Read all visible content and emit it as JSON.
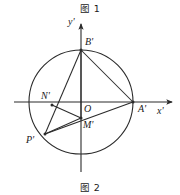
{
  "figure": {
    "caption_top": "图 1",
    "caption_bottom": "图 2",
    "stroke_color": "#2b2b2b",
    "background_color": "#ffffff"
  },
  "axes": {
    "x_label": "x'",
    "y_label": "y'",
    "origin_label": "O"
  },
  "points": {
    "A": "A'",
    "B": "B'",
    "N": "N'",
    "P": "P'",
    "M": "M'"
  },
  "geometry": {
    "circle": {
      "cx": 81,
      "cy": 102,
      "r": 52
    },
    "x_axis": {
      "x1": 14,
      "y1": 102,
      "x2": 172,
      "y2": 102
    },
    "y_axis": {
      "x1": 81,
      "y1": 172,
      "x2": 81,
      "y2": 24
    },
    "vertices": {
      "A": {
        "x": 133,
        "y": 102
      },
      "B": {
        "x": 81,
        "y": 50
      },
      "N": {
        "x": 52,
        "y": 105
      },
      "P": {
        "x": 45,
        "y": 134
      },
      "M": {
        "x": 81,
        "y": 118
      },
      "O": {
        "x": 81,
        "y": 102
      }
    },
    "segments": [
      {
        "name": "B-A",
        "from": "B",
        "to": "A"
      },
      {
        "name": "B-P",
        "from": "B",
        "to": "P"
      },
      {
        "name": "P-A",
        "from": "P",
        "to": "A"
      },
      {
        "name": "N-M",
        "from": "N",
        "to": "M"
      },
      {
        "name": "M-B",
        "from": "M",
        "to": "B"
      },
      {
        "name": "P-M",
        "from": "P",
        "to": "M"
      }
    ]
  }
}
